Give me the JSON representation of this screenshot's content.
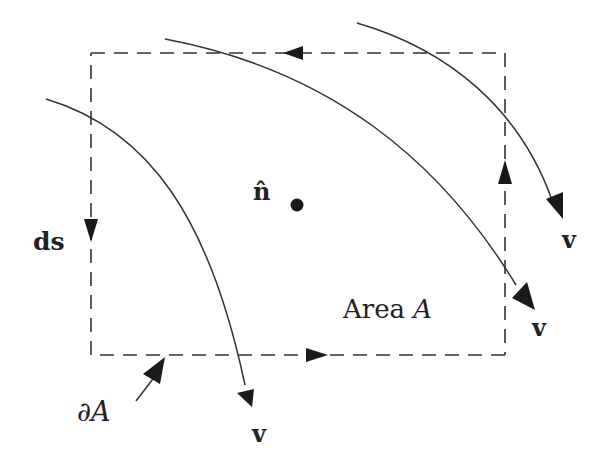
{
  "diagram": {
    "type": "flux-through-area",
    "colors": {
      "ink": "#222222",
      "background": "#ffffff"
    },
    "labels": {
      "normal": "n̂",
      "ds": "ds",
      "area_word": "Area ",
      "area_var": "A",
      "boundary": "∂A",
      "v1": "v",
      "v2": "v",
      "v3": "v"
    },
    "boundary_rectangle": {
      "x": 91,
      "y": 53,
      "width": 414,
      "height": 302,
      "style": "dashed",
      "orientation": "counterclockwise"
    },
    "streamlines": 3
  }
}
